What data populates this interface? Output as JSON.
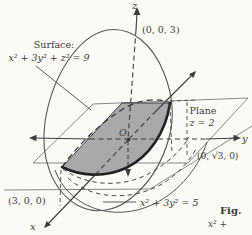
{
  "figure": {
    "bg_color": "#fbfaf5",
    "ink_color": "#3d3d3d",
    "shade_color": "#a9a9a9",
    "surface_label": {
      "line1": "Surface:",
      "line2": "x² + 3y² + z² = 9"
    },
    "plane_label": {
      "line1": "Plane",
      "line2": "z = 2"
    },
    "points": {
      "z_intercept": "(0, 0, 3)",
      "y_intercept": "(0, √3, 0)",
      "x_intercept": "(3, 0, 0)"
    },
    "projection_curve_label": "x² + 3y² = 5",
    "origin_label": "O",
    "axes": {
      "x": "x",
      "y": "y",
      "z": "z"
    },
    "caption": {
      "title": "Fig.",
      "text": "x² +"
    }
  }
}
